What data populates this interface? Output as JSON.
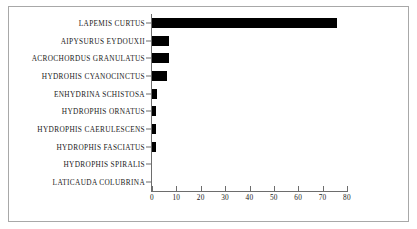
{
  "chart_data": {
    "type": "bar",
    "orientation": "horizontal",
    "title": "",
    "subtitle": "",
    "xlabel": "",
    "ylabel": "",
    "categories": [
      "LAPEMIS CURTUS",
      "AIPYSURUS EYDOUXII",
      "ACROCHORDUS GRANULATUS",
      "HYDROHIS CYANOCINCTUS",
      "ENHYDRINA SCHISTOSA",
      "HYDROPHIS  ORNATUS",
      "HYDROPHIS CAERULESCENS",
      "HYDROPHIS FASCIATUS",
      "HYDROPHIS SPIRALIS",
      "LATICAUDA COLUBRINA"
    ],
    "values": [
      76,
      7,
      7,
      6,
      2,
      1.5,
      1.5,
      1.5,
      0,
      0
    ],
    "xlim": [
      0,
      80
    ],
    "xticks": [
      0,
      10,
      20,
      30,
      40,
      50,
      60,
      70,
      80
    ],
    "xtick_labels": [
      "0",
      "10",
      "20",
      "30",
      "40",
      "50",
      "60",
      "70",
      "80"
    ],
    "grid": false,
    "legend": null,
    "bar_color": "#000000",
    "axis_color": "#6d6d6d",
    "frame_color": "#a8a8a8",
    "background": "#ffffff"
  }
}
